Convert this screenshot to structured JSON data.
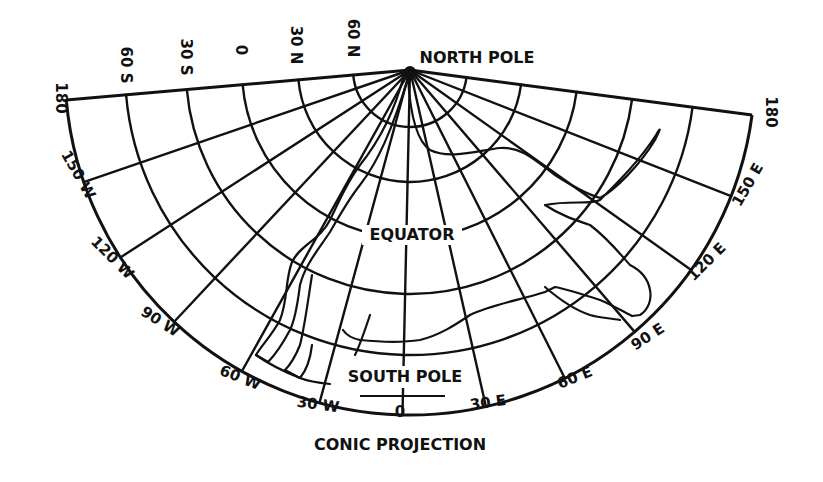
{
  "title": "CONIC PROJECTION",
  "labels": {
    "north_pole": "NORTH POLE",
    "south_pole": "SOUTH POLE",
    "equator": "EQUATOR"
  },
  "latitude_labels": [
    "60 S",
    "30 S",
    "0",
    "30 N",
    "60 N"
  ],
  "longitude_labels_left": [
    "180",
    "150 W",
    "120 W",
    "90 W",
    "60 W",
    "30 W"
  ],
  "longitude_center": "0",
  "longitude_labels_right": [
    "30 E",
    "60 E",
    "90 E",
    "120 E",
    "150 E",
    "180"
  ],
  "colors": {
    "ink": "#111111",
    "paper": "#ffffff"
  }
}
